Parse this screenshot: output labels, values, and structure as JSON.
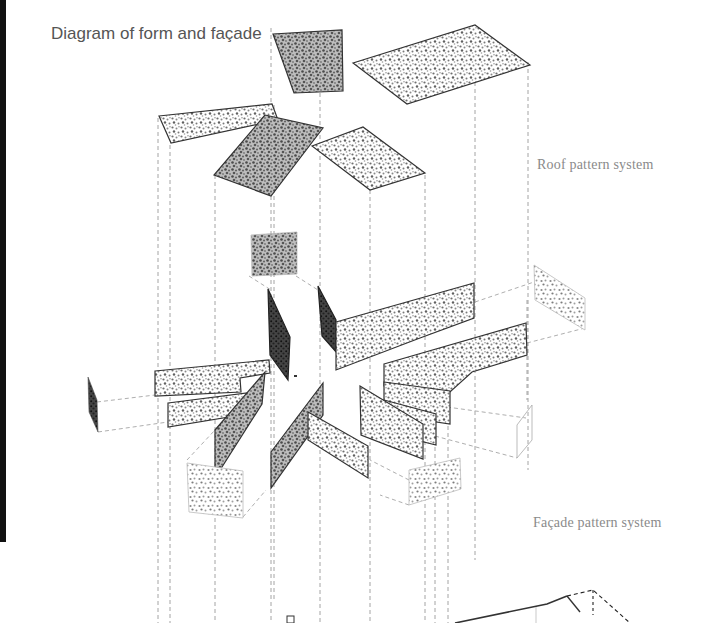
{
  "title": "Diagram of form and façade",
  "labels": {
    "roof": "Roof pattern system",
    "facade": "Façade pattern system"
  },
  "colors": {
    "background": "#ffffff",
    "outline": "#333333",
    "pattern": "#7a7a7a",
    "dashed": "#9a9a9a",
    "title_text": "#555555",
    "label_text": "#8a8a8a",
    "left_bar": "#111111"
  },
  "layers": [
    {
      "name": "roof",
      "panel_count": 6
    },
    {
      "name": "facade",
      "panel_count": 17
    },
    {
      "name": "base-form",
      "panel_count": 1
    }
  ]
}
